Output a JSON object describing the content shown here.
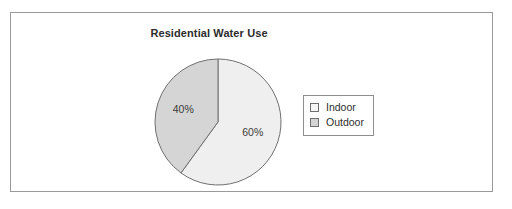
{
  "frame": {
    "border_color": "#9a9a9a",
    "background": "#ffffff"
  },
  "chart_data": {
    "type": "pie",
    "title": "Residential Water Use",
    "categories": [
      "Indoor",
      "Outdoor"
    ],
    "values": [
      60,
      40
    ],
    "labels": [
      "60%",
      "40%"
    ],
    "colors": [
      "#efefef",
      "#d5d5d5"
    ],
    "slice_border_color": "#707070",
    "start_angle_deg": 0,
    "direction": "clockwise",
    "legend_position": "right",
    "grid": false,
    "xlabel": "",
    "ylabel": ""
  },
  "legend": {
    "items": [
      {
        "label": "Indoor",
        "swatch_color": "#f6f6f6"
      },
      {
        "label": "Outdoor",
        "swatch_color": "#d5d5d5"
      }
    ]
  }
}
